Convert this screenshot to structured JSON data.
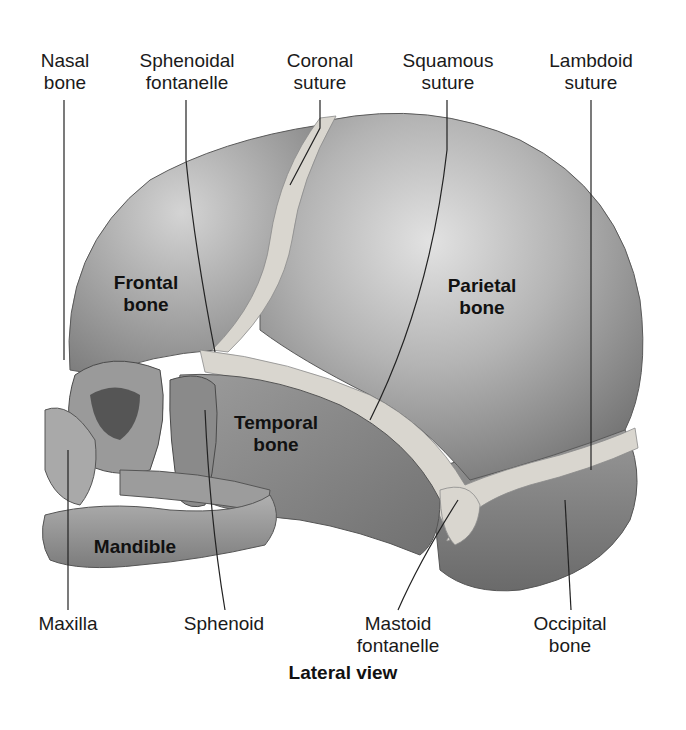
{
  "diagram": {
    "caption": "Lateral view",
    "top_labels": [
      {
        "id": "nasal_bone",
        "text": "Nasal\nbone"
      },
      {
        "id": "sphenoidal_fontanelle",
        "text": "Sphenoidal\nfontanelle"
      },
      {
        "id": "coronal_suture",
        "text": "Coronal\nsuture"
      },
      {
        "id": "squamous_suture",
        "text": "Squamous\nsuture"
      },
      {
        "id": "lambdoid_suture",
        "text": "Lambdoid\nsuture"
      }
    ],
    "bottom_labels": [
      {
        "id": "maxilla",
        "text": "Maxilla"
      },
      {
        "id": "sphenoid",
        "text": "Sphenoid"
      },
      {
        "id": "mastoid_fontanelle",
        "text": "Mastoid\nfontanelle"
      },
      {
        "id": "occipital_bone",
        "text": "Occipital\nbone"
      }
    ],
    "region_labels": [
      {
        "id": "frontal_bone",
        "text": "Frontal\nbone"
      },
      {
        "id": "parietal_bone",
        "text": "Parietal\nbone"
      },
      {
        "id": "temporal_bone",
        "text": "Temporal\nbone"
      },
      {
        "id": "mandible",
        "text": "Mandible"
      }
    ],
    "colors": {
      "bone": "#8c8c8c",
      "bone_light": "#c8c8c8",
      "suture": "#d9d6cf",
      "leader_line": "#222222"
    }
  }
}
